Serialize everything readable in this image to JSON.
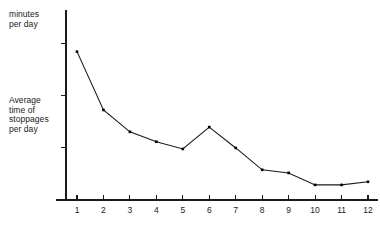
{
  "chart_data": {
    "type": "line",
    "title": "",
    "subtitle": "",
    "xlabel": "",
    "ylabel": "Average time of stoppages per day",
    "y_unit_label": "minutes per day",
    "categories": [
      "1",
      "2",
      "3",
      "4",
      "5",
      "6",
      "7",
      "8",
      "9",
      "10",
      "11",
      "12"
    ],
    "x": [
      1,
      2,
      3,
      4,
      5,
      6,
      7,
      8,
      9,
      10,
      11,
      12
    ],
    "values": [
      2.85,
      1.73,
      1.31,
      1.12,
      0.98,
      1.4,
      1.0,
      0.58,
      0.52,
      0.29,
      0.29,
      0.35
    ],
    "series": [
      {
        "name": "Average time of stoppages per day",
        "values": [
          2.85,
          1.73,
          1.31,
          1.12,
          0.98,
          1.4,
          1.0,
          0.58,
          0.52,
          0.29,
          0.29,
          0.35
        ]
      }
    ],
    "xlim": [
      0.25,
      12.45
    ],
    "ylim": [
      0,
      3.65
    ],
    "xticks": [
      1,
      2,
      3,
      4,
      5,
      6,
      7,
      8,
      9,
      10,
      11,
      12
    ],
    "xticklabels": [
      "1",
      "2",
      "3",
      "4",
      "5",
      "6",
      "7",
      "8",
      "9",
      "10",
      "11",
      "12"
    ],
    "yticks": [
      1,
      2,
      3
    ],
    "yticklabels": [
      "",
      "",
      ""
    ],
    "grid": false,
    "legend": false,
    "legend_position": "none",
    "marker": "square",
    "line_color": "#1a1a1a",
    "marker_color": "#000000",
    "axis_color": "#1a1a1a",
    "background": "#ffffff"
  },
  "labels": {
    "minutes_per_day": "minutes\nper day",
    "average_time": "Average\ntime of\nstoppages\nper day"
  },
  "colors": {
    "line": "#1a1a1a",
    "marker": "#000000",
    "axis": "#1a1a1a",
    "text": "#1a1a1a",
    "background": "#ffffff"
  }
}
